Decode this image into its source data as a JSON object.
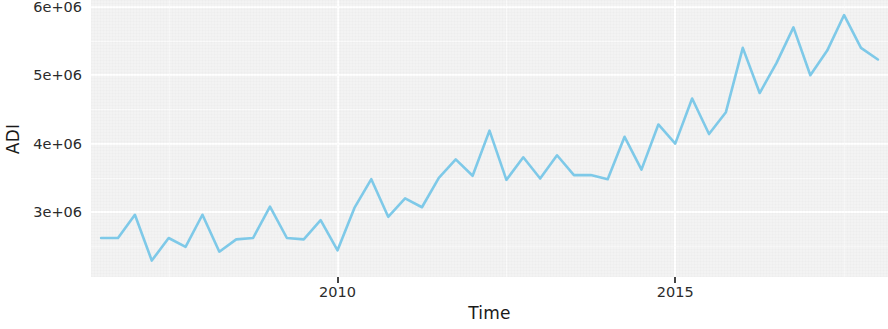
{
  "chart_data": {
    "type": "line",
    "title": "",
    "subtitle": "",
    "xlabel": "Time",
    "ylabel": "ADI",
    "xlim": [
      2006.35,
      2018.15
    ],
    "ylim": [
      2050000,
      6100000
    ],
    "grid": true,
    "legend": "none",
    "legend_position": "none",
    "line_color": "#7ec9e8",
    "panel_color": "#f3f3f3",
    "gridline_color": "#ffffff",
    "x_ticks": [
      2010,
      2015
    ],
    "x_tick_labels": [
      "2010",
      "2015"
    ],
    "y_ticks": [
      3000000,
      4000000,
      5000000,
      6000000
    ],
    "y_tick_labels": [
      "3e+06",
      "4e+06",
      "5e+06",
      "6e+06"
    ],
    "series": [
      {
        "name": "ADI",
        "frequency": "quarterly",
        "x": [
          2006.5,
          2006.75,
          2007.0,
          2007.25,
          2007.5,
          2007.75,
          2008.0,
          2008.25,
          2008.5,
          2008.75,
          2009.0,
          2009.25,
          2009.5,
          2009.75,
          2010.0,
          2010.25,
          2010.5,
          2010.75,
          2011.0,
          2011.25,
          2011.5,
          2011.75,
          2012.0,
          2012.25,
          2012.5,
          2012.75,
          2013.0,
          2013.25,
          2013.5,
          2013.75,
          2014.0,
          2014.25,
          2014.5,
          2014.75,
          2015.0,
          2015.25,
          2015.5,
          2015.75,
          2016.0,
          2016.25,
          2016.5,
          2016.75,
          2017.0,
          2017.25,
          2017.5,
          2017.75,
          2018.0
        ],
        "y": [
          2620000,
          2620000,
          2960000,
          2290000,
          2620000,
          2490000,
          2960000,
          2420000,
          2600000,
          2620000,
          3080000,
          2620000,
          2600000,
          2880000,
          2440000,
          3060000,
          3480000,
          2930000,
          3200000,
          3070000,
          3500000,
          3770000,
          3530000,
          4190000,
          3470000,
          3800000,
          3490000,
          3830000,
          3540000,
          3540000,
          3480000,
          4100000,
          3620000,
          4280000,
          4000000,
          4660000,
          4140000,
          4460000,
          5400000,
          4740000,
          5180000,
          5700000,
          5000000,
          5360000,
          5880000,
          5400000,
          5230000
        ]
      }
    ]
  },
  "axes": {
    "y_title": "ADI",
    "x_title": "Time"
  }
}
